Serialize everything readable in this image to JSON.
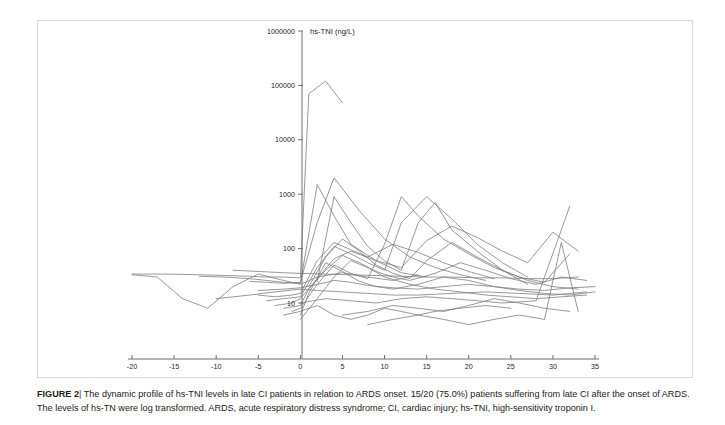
{
  "figure": {
    "label": "FIGURE 2",
    "separator": "|",
    "caption_line1": "The dynamic profile of hs-TNI levels in late CI patients in relation to ARDS onset. 15/20 (75.0%) patients suffering from late CI after the onset of ARDS.",
    "caption_line2": "The levels of hs-TN were log transformed. ARDS, acute respiratory distress syndrome; CI, cardiac injury; hs-TNI, high-sensitivity troponin I."
  },
  "colors": {
    "line": "#7d7d7d",
    "axis": "#6e6e6e",
    "border": "#d8d8d8",
    "text": "#1f1f1f",
    "background": "#ffffff"
  },
  "chart_data": {
    "type": "line",
    "title": "hs-TNI (ng/L)",
    "xlabel": "Days from onset of ARDS",
    "ylabel": "hs-TNI (ng/L)",
    "yscale": "log",
    "xlim": [
      -20,
      35
    ],
    "ylim": [
      3,
      1000000
    ],
    "grid": false,
    "legend": "none",
    "xticks": [
      -20,
      -15,
      -10,
      -5,
      0,
      5,
      10,
      15,
      20,
      25,
      30,
      35
    ],
    "xtick_labels": [
      "-20",
      "-15",
      "-10",
      "-5",
      "0",
      "5",
      "10",
      "15",
      "20",
      "25",
      "30",
      "35"
    ],
    "yticks": [
      10,
      100,
      1000,
      10000,
      100000,
      1000000
    ],
    "ytick_labels": [
      "10",
      "100",
      "1000",
      "10000",
      "100000",
      "1000000"
    ],
    "n_series": 20,
    "series": [
      {
        "name": "patient-01",
        "x": [
          -20,
          -17,
          -14,
          -11,
          -8,
          -5,
          -2,
          0,
          2,
          5,
          8,
          11,
          14
        ],
        "values": [
          33,
          30,
          12,
          8,
          20,
          34,
          26,
          22,
          30,
          36,
          30,
          26,
          33
        ]
      },
      {
        "name": "patient-02",
        "x": [
          -20,
          -16,
          -12,
          -9,
          -6,
          -4,
          -2,
          0,
          1,
          3,
          5
        ],
        "values": [
          34,
          34,
          33,
          32,
          31,
          30,
          30,
          29,
          70000,
          120000,
          48000
        ]
      },
      {
        "name": "patient-03",
        "x": [
          -12,
          -9,
          -6,
          -4,
          -2,
          0,
          2,
          4,
          6,
          9,
          12,
          15
        ],
        "values": [
          31,
          30,
          28,
          26,
          24,
          23,
          1500,
          400,
          120,
          60,
          36,
          30
        ]
      },
      {
        "name": "patient-04",
        "x": [
          -6,
          -4,
          -2,
          0,
          2,
          4,
          7,
          10,
          13,
          16,
          19,
          22
        ],
        "values": [
          25,
          24,
          23,
          24,
          300,
          2000,
          500,
          150,
          70,
          45,
          33,
          26
        ]
      },
      {
        "name": "patient-05",
        "x": [
          -5,
          -3,
          -1,
          0,
          2,
          4,
          6,
          8,
          11,
          14,
          17,
          20,
          23
        ],
        "values": [
          14,
          13,
          14,
          15,
          60,
          130,
          95,
          70,
          120,
          85,
          55,
          38,
          28
        ]
      },
      {
        "name": "patient-06",
        "x": [
          -4,
          -2,
          0,
          2,
          4,
          6,
          8,
          10,
          12,
          15,
          18,
          21,
          24,
          27
        ],
        "values": [
          11,
          12,
          13,
          45,
          110,
          80,
          55,
          40,
          300,
          900,
          350,
          120,
          55,
          30
        ]
      },
      {
        "name": "patient-07",
        "x": [
          -3,
          -1,
          0,
          2,
          4,
          6,
          9,
          12,
          15,
          18,
          21,
          24,
          27,
          30,
          33
        ],
        "values": [
          9,
          10,
          12,
          28,
          65,
          90,
          60,
          45,
          140,
          260,
          160,
          90,
          55,
          200,
          90
        ]
      },
      {
        "name": "patient-08",
        "x": [
          -2,
          0,
          1,
          3,
          5,
          7,
          9,
          11,
          13,
          16,
          19,
          22,
          25,
          28,
          31,
          34
        ],
        "values": [
          8,
          9,
          18,
          40,
          75,
          55,
          38,
          30,
          26,
          35,
          55,
          40,
          28,
          22,
          30,
          26
        ]
      },
      {
        "name": "patient-09",
        "x": [
          -1,
          0,
          2,
          4,
          6,
          8,
          10,
          12,
          14,
          17,
          20,
          23,
          26,
          29,
          32
        ],
        "values": [
          7,
          8,
          22,
          50,
          35,
          28,
          120,
          900,
          400,
          150,
          80,
          45,
          30,
          24,
          80
        ]
      },
      {
        "name": "patient-10",
        "x": [
          0,
          1,
          3,
          5,
          7,
          9,
          11,
          14,
          17,
          20,
          23,
          26,
          29,
          32,
          35
        ],
        "values": [
          6,
          15,
          55,
          38,
          25,
          20,
          18,
          22,
          30,
          26,
          20,
          17,
          15,
          14,
          16
        ]
      },
      {
        "name": "patient-11",
        "x": [
          -8,
          -5,
          -2,
          0,
          3,
          6,
          9,
          12,
          15,
          18,
          21,
          24,
          27,
          30,
          33
        ],
        "values": [
          40,
          38,
          36,
          35,
          34,
          33,
          32,
          31,
          30,
          30,
          29,
          29,
          28,
          28,
          30
        ]
      },
      {
        "name": "patient-12",
        "x": [
          -10,
          -6,
          -3,
          0,
          2,
          5,
          8,
          11,
          14,
          18,
          22,
          26,
          30,
          34
        ],
        "values": [
          12,
          14,
          16,
          18,
          17,
          16,
          15,
          14,
          14,
          15,
          16,
          15,
          14,
          16
        ]
      },
      {
        "name": "patient-13",
        "x": [
          0,
          2,
          4,
          6,
          8,
          10,
          13,
          16,
          19,
          22,
          25,
          28,
          31,
          34
        ],
        "values": [
          5,
          12,
          30,
          60,
          45,
          30,
          22,
          18,
          16,
          14,
          13,
          12,
          13,
          14
        ]
      },
      {
        "name": "patient-14",
        "x": [
          -2,
          0,
          2,
          4,
          6,
          8,
          10,
          12,
          14,
          16,
          19,
          22,
          25
        ],
        "values": [
          6,
          7,
          9,
          6,
          5,
          6,
          8,
          7,
          6,
          7,
          8,
          9,
          8
        ]
      },
      {
        "name": "patient-15",
        "x": [
          1,
          3,
          5,
          7,
          9,
          11,
          13,
          15,
          18,
          21,
          24,
          27,
          30,
          33
        ],
        "values": [
          20,
          70,
          150,
          90,
          50,
          35,
          28,
          60,
          130,
          70,
          40,
          26,
          20,
          18
        ]
      },
      {
        "name": "patient-16",
        "x": [
          2,
          4,
          6,
          8,
          10,
          12,
          14,
          16,
          18,
          21,
          24,
          27
        ],
        "values": [
          25,
          900,
          300,
          110,
          60,
          40,
          300,
          700,
          220,
          90,
          40,
          22
        ]
      },
      {
        "name": "patient-17",
        "x": [
          0,
          3,
          6,
          9,
          12,
          15,
          18,
          21,
          24,
          28,
          32
        ],
        "values": [
          10,
          12,
          11,
          10,
          12,
          13,
          12,
          11,
          10,
          11,
          600
        ]
      },
      {
        "name": "patient-18",
        "x": [
          -5,
          -2,
          0,
          2,
          4,
          6,
          8,
          11,
          14,
          17,
          20,
          23,
          26,
          29,
          32,
          35
        ],
        "values": [
          17,
          18,
          19,
          22,
          26,
          24,
          21,
          19,
          18,
          20,
          22,
          20,
          18,
          17,
          19,
          20
        ]
      },
      {
        "name": "patient-19",
        "x": [
          5,
          8,
          11,
          14,
          17,
          20,
          23,
          26,
          29,
          32
        ],
        "values": [
          6,
          7,
          9,
          8,
          7,
          9,
          12,
          10,
          8,
          7
        ]
      },
      {
        "name": "patient-20",
        "x": [
          8,
          11,
          14,
          17,
          20,
          23,
          26,
          29,
          31,
          33
        ],
        "values": [
          4,
          5,
          6,
          5,
          4,
          5,
          6,
          5,
          130,
          7
        ]
      }
    ]
  }
}
